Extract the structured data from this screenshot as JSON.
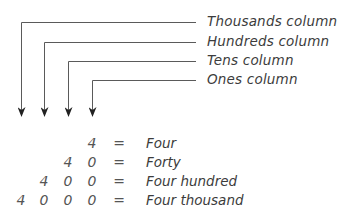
{
  "diagram": {
    "columns": [
      {
        "label": "Thousands column",
        "x": 21,
        "y": 22
      },
      {
        "label": "Hundreds column",
        "x": 44,
        "y": 42
      },
      {
        "label": "Tens column",
        "x": 68,
        "y": 61
      },
      {
        "label": "Ones column",
        "x": 92,
        "y": 80
      }
    ],
    "rows": [
      {
        "digits": [
          "",
          "",
          "",
          "4"
        ],
        "equals": "=",
        "word": "Four"
      },
      {
        "digits": [
          "",
          "",
          "4",
          "0"
        ],
        "equals": "=",
        "word": "Forty"
      },
      {
        "digits": [
          "",
          "4",
          "0",
          "0"
        ],
        "equals": "=",
        "word": "Four hundred"
      },
      {
        "digits": [
          "4",
          "0",
          "0",
          "0"
        ],
        "equals": "=",
        "word": "Four thousand"
      }
    ],
    "colors": {
      "line": "#555555",
      "text": "#3c3c3c"
    }
  }
}
